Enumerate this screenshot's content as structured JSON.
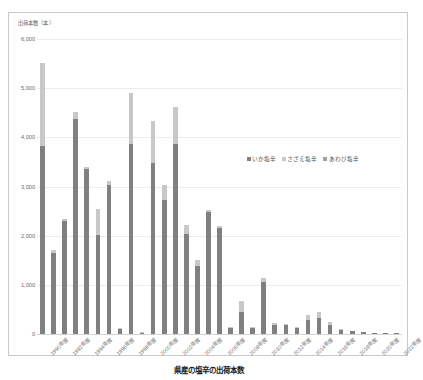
{
  "chart_data": {
    "type": "bar",
    "stacked": true,
    "title": "県産の塩辛の出荷本数",
    "xlabel": "",
    "ylabel": "出荷本数（本）",
    "ylim": [
      0,
      6000
    ],
    "ytick_step": 1000,
    "grid": true,
    "legend_position": "center-right",
    "ytick_labels": [
      "6,000",
      "5,000",
      "4,000",
      "3,000",
      "2,000",
      "1,000",
      "0"
    ],
    "ytick_values": [
      6000,
      5000,
      4000,
      3000,
      2000,
      1000,
      0
    ],
    "categories": [
      "1990年度",
      "1991年度",
      "1992年度",
      "1993年度",
      "1994年度",
      "1995年度",
      "1996年度",
      "1997年度",
      "1998年度",
      "1999年度",
      "2000年度",
      "2001年度",
      "2002年度",
      "2003年度",
      "2004年度",
      "2005年度",
      "2006年度",
      "2007年度",
      "2008年度",
      "2009年度",
      "2010年度",
      "2011年度",
      "2012年度",
      "2013年度",
      "2014年度",
      "2015年度",
      "2016年度",
      "2017年度",
      "2018年度",
      "2019年度",
      "2020年度",
      "2021年度",
      "2022年度"
    ],
    "xtick_labels_shown": [
      "1990年度",
      "1992年度",
      "1994年度",
      "1996年度",
      "1998年度",
      "2000年度",
      "2002年度",
      "2004年度",
      "2006年度",
      "2008年度",
      "2010年度",
      "2012年度",
      "2014年度",
      "2016年度",
      "2018年度",
      "2020年度",
      "2022年度"
    ],
    "series": [
      {
        "name": "いか塩辛",
        "color": "#808080",
        "values": [
          3820,
          1640,
          2290,
          4370,
          3360,
          2010,
          3040,
          100,
          3870,
          30,
          3480,
          2730,
          3870,
          2040,
          1390,
          2490,
          2160,
          130,
          450,
          120,
          1060,
          190,
          180,
          120,
          290,
          330,
          190,
          90,
          60,
          40,
          25,
          20,
          15
        ]
      },
      {
        "name": "さざえ塩辛",
        "color": "#c8c8c8",
        "values": [
          1700,
          70,
          40,
          140,
          30,
          540,
          70,
          20,
          1030,
          10,
          850,
          300,
          740,
          180,
          110,
          30,
          30,
          20,
          220,
          20,
          70,
          30,
          30,
          30,
          100,
          110,
          50,
          20,
          10,
          10,
          5,
          5,
          5
        ]
      },
      {
        "name": "あわび塩辛",
        "color": "#a0a0a0",
        "values": [
          0,
          0,
          0,
          0,
          0,
          0,
          0,
          0,
          0,
          0,
          0,
          0,
          0,
          0,
          0,
          0,
          0,
          0,
          0,
          0,
          0,
          0,
          0,
          0,
          0,
          0,
          0,
          0,
          0,
          0,
          0,
          0,
          0
        ]
      }
    ],
    "totals": [
      5520,
      1710,
      2330,
      4510,
      3390,
      2550,
      3110,
      120,
      4900,
      40,
      4330,
      3030,
      4610,
      2220,
      1500,
      2520,
      2190,
      150,
      670,
      140,
      1130,
      220,
      210,
      150,
      390,
      440,
      240,
      110,
      70,
      50,
      30,
      25,
      20
    ]
  },
  "legend": {
    "items": [
      {
        "label": "いか塩辛",
        "color": "#808080"
      },
      {
        "label": "さざえ塩辛",
        "color": "#c8c8c8"
      },
      {
        "label": "あわび塩辛",
        "color": "#a0a0a0"
      }
    ]
  },
  "caption": {
    "text": "県産の塩辛の出荷本数"
  }
}
